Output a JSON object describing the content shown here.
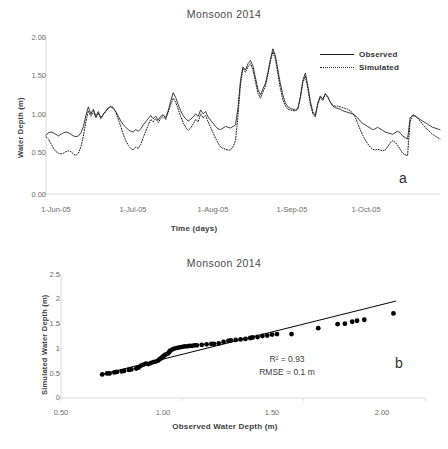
{
  "figure": {
    "panel_a_letter": "a",
    "panel_b_letter": "b"
  },
  "panel_a": {
    "title": "Monsoon 2014",
    "xlabel": "Time (days)",
    "ylabel": "Water Depth (m)",
    "yticks": [
      "0.00",
      "0.50",
      "1.00",
      "1.50",
      "2.00"
    ],
    "xticks": [
      "1-Jun-05",
      "1-Jul-05",
      "1-Aug-05",
      "1-Sep-05",
      "1-Oct-05"
    ],
    "legend": [
      {
        "label": "Observed",
        "style": "solid"
      },
      {
        "label": "Simulated",
        "style": "dotted"
      }
    ]
  },
  "panel_b": {
    "title": "Monsoon 2014",
    "xlabel": "Observed Water Depth (m)",
    "ylabel": "Simulated Water Depth (m)",
    "yticks": [
      "0",
      "0.5",
      "1",
      "1.5",
      "2",
      "2.5"
    ],
    "xticks": [
      "0.50",
      "1.00",
      "1.50",
      "2.00"
    ],
    "r2_text": "R² = 0.93",
    "rmse_text": "RMSE = 0.1 m"
  },
  "chart_data": [
    {
      "id": "panel_a",
      "type": "line",
      "title": "Monsoon 2014",
      "xlabel": "Time (days)",
      "ylabel": "Water Depth (m)",
      "ylim": [
        0.0,
        2.0
      ],
      "yticks": [
        0.0,
        0.5,
        1.0,
        1.5,
        2.0
      ],
      "xtick_labels": [
        "1-Jun-05",
        "1-Jul-05",
        "1-Aug-05",
        "1-Sep-05",
        "1-Oct-05"
      ],
      "xtick_positions": [
        0,
        30,
        61,
        92,
        122
      ],
      "xlim": [
        0,
        150
      ],
      "grid": false,
      "legend_position": "top-right",
      "series": [
        {
          "name": "Observed",
          "style": "solid",
          "color": "#1a1a1a",
          "values": [
            0.75,
            0.78,
            0.79,
            0.78,
            0.76,
            0.74,
            0.76,
            0.78,
            0.79,
            0.78,
            0.76,
            0.74,
            0.73,
            0.74,
            0.78,
            0.86,
            1.0,
            1.11,
            1.02,
            1.08,
            0.99,
            1.05,
            0.97,
            1.02,
            1.06,
            1.1,
            1.11,
            1.09,
            1.05,
            0.99,
            0.93,
            0.88,
            0.85,
            0.82,
            0.8,
            0.79,
            0.82,
            0.8,
            0.83,
            0.88,
            0.92,
            0.96,
            1.0,
            0.96,
            0.99,
            0.94,
            0.99,
            1.01,
            0.97,
            1.06,
            1.18,
            1.29,
            1.23,
            1.14,
            1.06,
            1.0,
            0.96,
            0.93,
            0.95,
            0.98,
            1.02,
            0.99,
            1.07,
            1.02,
            1.05,
            0.98,
            0.94,
            0.9,
            0.86,
            0.83,
            0.82,
            0.84,
            0.86,
            0.85,
            0.84,
            0.86,
            0.88,
            1.1,
            1.45,
            1.62,
            1.58,
            1.66,
            1.7,
            1.63,
            1.48,
            1.33,
            1.26,
            1.34,
            1.41,
            1.55,
            1.72,
            1.85,
            1.76,
            1.58,
            1.4,
            1.26,
            1.16,
            1.11,
            1.09,
            1.08,
            1.07,
            1.09,
            1.24,
            1.45,
            1.54,
            1.38,
            1.18,
            1.05,
            1.0,
            1.16,
            1.25,
            1.21,
            1.28,
            1.24,
            1.17,
            1.12,
            1.1,
            1.09,
            1.08,
            1.06,
            1.05,
            1.04,
            1.03,
            1.02,
            1.0,
            0.97,
            0.93,
            0.9,
            0.88,
            0.86,
            0.84,
            0.82,
            0.83,
            0.85,
            0.83,
            0.81,
            0.79,
            0.78,
            0.77,
            0.76,
            0.78,
            0.8,
            0.78,
            0.74,
            0.72,
            0.7,
            0.97,
            1.0,
            0.99,
            0.97,
            0.95,
            0.93,
            0.91,
            0.89,
            0.87,
            0.85,
            0.84,
            0.83,
            0.82
          ]
        },
        {
          "name": "Simulated",
          "style": "dotted",
          "color": "#1a1a1a",
          "values": [
            0.73,
            0.7,
            0.64,
            0.58,
            0.54,
            0.52,
            0.51,
            0.52,
            0.54,
            0.55,
            0.54,
            0.51,
            0.49,
            0.52,
            0.6,
            0.74,
            0.92,
            1.06,
            0.99,
            1.05,
            0.97,
            1.03,
            0.96,
            1.01,
            1.05,
            1.09,
            1.12,
            1.1,
            1.04,
            0.95,
            0.86,
            0.76,
            0.68,
            0.62,
            0.58,
            0.56,
            0.6,
            0.58,
            0.63,
            0.72,
            0.8,
            0.88,
            0.95,
            0.92,
            0.96,
            0.91,
            0.96,
            0.99,
            0.95,
            1.04,
            1.14,
            1.22,
            1.17,
            1.08,
            0.99,
            0.91,
            0.85,
            0.81,
            0.84,
            0.89,
            0.95,
            0.92,
            1.02,
            0.97,
            1.0,
            0.92,
            0.85,
            0.78,
            0.71,
            0.65,
            0.6,
            0.58,
            0.57,
            0.56,
            0.56,
            0.6,
            0.68,
            1.0,
            1.4,
            1.6,
            1.55,
            1.62,
            1.66,
            1.58,
            1.43,
            1.28,
            1.22,
            1.3,
            1.38,
            1.52,
            1.69,
            1.81,
            1.72,
            1.53,
            1.34,
            1.2,
            1.12,
            1.08,
            1.07,
            1.06,
            1.06,
            1.08,
            1.22,
            1.42,
            1.5,
            1.34,
            1.14,
            1.02,
            0.98,
            1.14,
            1.23,
            1.19,
            1.27,
            1.23,
            1.17,
            1.13,
            1.12,
            1.12,
            1.11,
            1.1,
            1.09,
            1.08,
            1.06,
            1.03,
            0.98,
            0.9,
            0.82,
            0.75,
            0.69,
            0.64,
            0.6,
            0.57,
            0.56,
            0.57,
            0.56,
            0.55,
            0.56,
            0.6,
            0.65,
            0.68,
            0.66,
            0.62,
            0.57,
            0.52,
            0.5,
            0.49,
            0.92,
            1.01,
            1.0,
            0.97,
            0.93,
            0.89,
            0.85,
            0.82,
            0.79,
            0.76,
            0.74,
            0.72,
            0.7
          ]
        }
      ]
    },
    {
      "id": "panel_b",
      "type": "scatter",
      "title": "Monsoon 2014",
      "xlabel": "Observed Water Depth (m)",
      "ylabel": "Simulated Water Depth (m)",
      "xlim": [
        0.5,
        2.0
      ],
      "ylim": [
        0,
        2.5
      ],
      "xticks": [
        0.5,
        1.0,
        1.5,
        2.0
      ],
      "yticks": [
        0,
        0.5,
        1,
        1.5,
        2,
        2.5
      ],
      "grid": false,
      "marker": "filled-circle",
      "marker_color": "#000000",
      "annotations": [
        "R² = 0.93",
        "RMSE = 0.1 m"
      ],
      "trendline": {
        "x": [
          0.66,
          1.88
        ],
        "y": [
          0.47,
          1.97
        ],
        "style": "solid",
        "color": "#000000"
      },
      "points": [
        [
          0.67,
          0.48
        ],
        [
          0.69,
          0.5
        ],
        [
          0.7,
          0.5
        ],
        [
          0.72,
          0.52
        ],
        [
          0.73,
          0.53
        ],
        [
          0.75,
          0.54
        ],
        [
          0.76,
          0.55
        ],
        [
          0.78,
          0.57
        ],
        [
          0.79,
          0.58
        ],
        [
          0.81,
          0.6
        ],
        [
          0.82,
          0.62
        ],
        [
          0.83,
          0.66
        ],
        [
          0.84,
          0.68
        ],
        [
          0.85,
          0.7
        ],
        [
          0.86,
          0.69
        ],
        [
          0.87,
          0.71
        ],
        [
          0.88,
          0.73
        ],
        [
          0.89,
          0.74
        ],
        [
          0.9,
          0.76
        ],
        [
          0.905,
          0.78
        ],
        [
          0.91,
          0.8
        ],
        [
          0.915,
          0.82
        ],
        [
          0.92,
          0.84
        ],
        [
          0.925,
          0.86
        ],
        [
          0.93,
          0.88
        ],
        [
          0.94,
          0.9
        ],
        [
          0.945,
          0.93
        ],
        [
          0.95,
          0.96
        ],
        [
          0.96,
          0.99
        ],
        [
          0.97,
          1.01
        ],
        [
          0.98,
          1.02
        ],
        [
          0.99,
          1.03
        ],
        [
          1.0,
          1.04
        ],
        [
          1.01,
          1.05
        ],
        [
          1.02,
          1.05
        ],
        [
          1.03,
          1.06
        ],
        [
          1.04,
          1.06
        ],
        [
          1.05,
          1.07
        ],
        [
          1.06,
          1.07
        ],
        [
          1.08,
          1.08
        ],
        [
          1.1,
          1.09
        ],
        [
          1.12,
          1.1
        ],
        [
          1.13,
          1.1
        ],
        [
          1.15,
          1.11
        ],
        [
          1.17,
          1.14
        ],
        [
          1.19,
          1.16
        ],
        [
          1.2,
          1.17
        ],
        [
          1.22,
          1.18
        ],
        [
          1.24,
          1.19
        ],
        [
          1.26,
          1.2
        ],
        [
          1.28,
          1.22
        ],
        [
          1.29,
          1.23
        ],
        [
          1.31,
          1.24
        ],
        [
          1.33,
          1.26
        ],
        [
          1.35,
          1.27
        ],
        [
          1.37,
          1.29
        ],
        [
          1.39,
          1.3
        ],
        [
          1.45,
          1.3
        ],
        [
          1.56,
          1.42
        ],
        [
          1.64,
          1.5
        ],
        [
          1.67,
          1.51
        ],
        [
          1.7,
          1.55
        ],
        [
          1.72,
          1.57
        ],
        [
          1.75,
          1.59
        ],
        [
          1.87,
          1.72
        ]
      ]
    }
  ]
}
